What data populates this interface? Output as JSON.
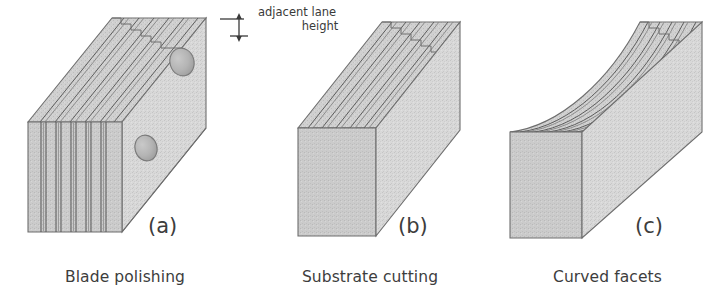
{
  "figure": {
    "background": "#ffffff",
    "width": 725,
    "height": 290,
    "ink_color": "#3a3a3a",
    "face_fill": "#d6d6d6",
    "top_fill": "#cfcfcf",
    "end_fill": "#cacaca",
    "edge_stroke": "#6b6b6b"
  },
  "annotation": {
    "line1": "adjacent lane",
    "line2": "height",
    "marker": "double-headed-vertical-dimension-arrow"
  },
  "panels": [
    {
      "id": "a",
      "letter": "(a)",
      "caption": "Blade polishing",
      "description": "stack of separated blades with grooved angled top and two elliptical holes on the front face",
      "blade_count": 7,
      "ridge_count": 6,
      "hole_count": 2
    },
    {
      "id": "b",
      "letter": "(b)",
      "caption": "Substrate cutting",
      "description": "solid rectangular block with straight v-grooves cut into the angled top surface",
      "blade_count": 0,
      "ridge_count": 6,
      "hole_count": 0
    },
    {
      "id": "c",
      "letter": "(c)",
      "caption": "Curved facets",
      "description": "solid rectangular block with upward-bowed curved facet grooves on the top surface",
      "blade_count": 0,
      "ridge_count": 6,
      "hole_count": 0
    }
  ]
}
